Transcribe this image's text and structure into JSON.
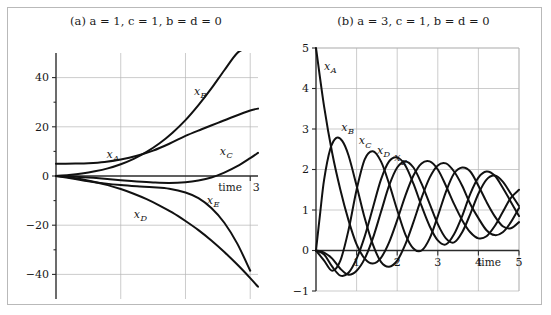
{
  "figure": {
    "panels": [
      {
        "id": "a",
        "title_prefix": "(a)",
        "title": "(a) a = 1,  c = 1,  b = d = 0",
        "params": {
          "a": "1",
          "c": "1",
          "b_d": "0"
        },
        "xlabel": "time",
        "x_ticks": [
          "3"
        ],
        "y_ticks": [
          "40",
          "20",
          "0",
          "−20",
          "−40"
        ],
        "curve_labels": [
          "x",
          "x",
          "x",
          "x",
          "x"
        ],
        "curve_subs": [
          "A",
          "B",
          "C",
          "D",
          "E"
        ]
      },
      {
        "id": "b",
        "title_prefix": "(b)",
        "title": "(b) a = 3, c = 1,  b = d = 0",
        "params": {
          "a": "3",
          "c": "1",
          "b_d": "0"
        },
        "xlabel": "time",
        "x_ticks": [
          "1",
          "2",
          "3",
          "4",
          "5"
        ],
        "y_ticks": [
          "5",
          "4",
          "3",
          "2",
          "1",
          "0",
          "−1"
        ],
        "curve_labels": [
          "x",
          "x",
          "x",
          "x",
          "x"
        ],
        "curve_subs": [
          "A",
          "B",
          "C",
          "D",
          "E"
        ]
      }
    ]
  },
  "chart_data": [
    {
      "type": "line",
      "panel": "a",
      "title": "(a) a = 1, c = 1, b = d = 0",
      "xlabel": "time",
      "ylabel": "",
      "xlim": [
        0,
        3.12
      ],
      "ylim": [
        -50,
        50
      ],
      "xticks": [
        3
      ],
      "yticks": [
        40,
        20,
        0,
        -20,
        -40
      ],
      "grid": true,
      "legend": "inline-labels",
      "series": [
        {
          "name": "x_A",
          "label": "x_A",
          "label_at": [
            0.78,
            7.5
          ],
          "x": [
            0,
            0.15,
            0.3,
            0.5,
            0.75,
            1.0,
            1.25,
            1.5,
            1.75,
            2.0,
            2.25,
            2.5,
            2.75,
            3.0,
            3.12
          ],
          "y": [
            5.0,
            5.0,
            5.05,
            5.2,
            5.7,
            6.7,
            8.2,
            10.3,
            13.1,
            16.3,
            19.0,
            21.6,
            24.2,
            26.6,
            27.4
          ]
        },
        {
          "name": "x_B",
          "label": "x_B",
          "label_at": [
            2.13,
            33.0
          ],
          "x": [
            0,
            0.2,
            0.4,
            0.6,
            0.8,
            1.0,
            1.2,
            1.4,
            1.6,
            1.8,
            2.0,
            2.2,
            2.4,
            2.6,
            2.8,
            2.95
          ],
          "y": [
            0.0,
            0.4,
            1.0,
            1.9,
            3.1,
            4.8,
            7.0,
            9.8,
            13.3,
            17.6,
            22.7,
            28.8,
            35.6,
            43.0,
            50.0,
            52.0
          ]
        },
        {
          "name": "x_C",
          "label": "x_C",
          "label_at": [
            2.53,
            8.6
          ],
          "x": [
            0,
            0.25,
            0.5,
            0.75,
            1.0,
            1.25,
            1.5,
            1.75,
            2.0,
            2.2,
            2.4,
            2.6,
            2.8,
            3.0,
            3.12
          ],
          "y": [
            0.0,
            -0.2,
            -0.6,
            -1.1,
            -1.7,
            -2.2,
            -2.6,
            -2.8,
            -2.5,
            -1.8,
            -0.6,
            1.4,
            4.0,
            7.3,
            9.4
          ]
        },
        {
          "name": "x_D",
          "label": "x_D",
          "label_at": [
            1.2,
            -17.0
          ],
          "x": [
            0,
            0.2,
            0.4,
            0.6,
            0.8,
            1.0,
            1.2,
            1.4,
            1.6,
            1.8,
            2.0,
            2.2,
            2.4,
            2.6,
            2.8,
            3.0,
            3.12
          ],
          "y": [
            0.0,
            -0.5,
            -1.3,
            -2.4,
            -3.7,
            -5.3,
            -7.2,
            -9.4,
            -12.0,
            -14.9,
            -18.3,
            -22.0,
            -26.2,
            -30.9,
            -36.0,
            -41.5,
            -45.0
          ]
        },
        {
          "name": "x_E",
          "label": "x_E",
          "label_at": [
            2.33,
            -11.5
          ],
          "x": [
            0,
            0.25,
            0.5,
            0.75,
            1.0,
            1.25,
            1.5,
            1.75,
            2.0,
            2.2,
            2.4,
            2.6,
            2.8,
            3.0
          ],
          "y": [
            0.0,
            -1.0,
            -2.1,
            -3.0,
            -3.7,
            -4.2,
            -4.6,
            -5.2,
            -6.7,
            -9.0,
            -13.0,
            -19.0,
            -27.5,
            -38.5
          ]
        }
      ]
    },
    {
      "type": "line",
      "panel": "b",
      "title": "(b) a = 3, c = 1, b = d = 0",
      "xlabel": "time",
      "ylabel": "",
      "xlim": [
        0,
        5.0
      ],
      "ylim": [
        -1,
        5
      ],
      "xticks": [
        1,
        2,
        3,
        4,
        5
      ],
      "yticks": [
        5,
        4,
        3,
        2,
        1,
        0,
        -1
      ],
      "grid": true,
      "legend": "inline-labels",
      "comment": "Five damped oscillations with progressively delayed phase; amplitude decays toward mean ~1.0",
      "series": [
        {
          "name": "x_A",
          "label": "x_A",
          "label_at": [
            0.2,
            4.45
          ],
          "description": "starts at 5, decays steeply, then oscillates about 1",
          "x": [
            0,
            0.2,
            0.4,
            0.6,
            0.8,
            1.0,
            1.2,
            1.4,
            1.6,
            1.8,
            2.0,
            2.2,
            2.4,
            2.6,
            2.8,
            3.0,
            3.2,
            3.4,
            3.6,
            3.8,
            4.0,
            4.2,
            4.4,
            4.6,
            4.8,
            5.0
          ],
          "y": [
            5.0,
            3.55,
            2.4,
            1.5,
            0.75,
            0.15,
            -0.2,
            -0.32,
            -0.18,
            0.2,
            0.75,
            1.35,
            1.85,
            2.15,
            2.2,
            2.0,
            1.6,
            1.15,
            0.75,
            0.45,
            0.3,
            0.35,
            0.6,
            0.95,
            1.3,
            1.5
          ]
        },
        {
          "name": "x_B",
          "label": "x_B",
          "label_at": [
            0.62,
            2.95
          ],
          "x": [
            0,
            0.1,
            0.2,
            0.35,
            0.5,
            0.65,
            0.8,
            1.0,
            1.2,
            1.4,
            1.6,
            1.8,
            2.0,
            2.2,
            2.4,
            2.6,
            2.8,
            3.0,
            3.2,
            3.4,
            3.6,
            3.8,
            4.0,
            4.2,
            4.4,
            4.6,
            4.8,
            5.0
          ],
          "y": [
            0.0,
            0.9,
            1.75,
            2.5,
            2.78,
            2.7,
            2.35,
            1.6,
            0.8,
            0.15,
            -0.28,
            -0.4,
            -0.25,
            0.15,
            0.7,
            1.3,
            1.8,
            2.1,
            2.15,
            1.95,
            1.6,
            1.15,
            0.8,
            0.5,
            0.38,
            0.45,
            0.7,
            1.05
          ]
        },
        {
          "name": "x_C",
          "label": "x_C",
          "label_at": [
            1.05,
            2.62
          ],
          "x": [
            0,
            0.2,
            0.4,
            0.6,
            0.8,
            1.0,
            1.2,
            1.4,
            1.6,
            1.8,
            2.0,
            2.2,
            2.4,
            2.6,
            2.8,
            3.0,
            3.2,
            3.4,
            3.6,
            3.8,
            4.0,
            4.2,
            4.4,
            4.6,
            4.8,
            5.0
          ],
          "y": [
            0.0,
            -0.25,
            -0.5,
            -0.25,
            0.5,
            1.5,
            2.25,
            2.45,
            2.2,
            1.65,
            1.0,
            0.4,
            0.05,
            0.0,
            0.3,
            0.85,
            1.45,
            1.9,
            2.05,
            1.95,
            1.6,
            1.2,
            0.85,
            0.6,
            0.55,
            0.7
          ]
        },
        {
          "name": "x_D",
          "label": "x_D",
          "label_at": [
            1.5,
            2.38
          ],
          "x": [
            0,
            0.2,
            0.4,
            0.6,
            0.8,
            1.0,
            1.2,
            1.4,
            1.6,
            1.8,
            2.0,
            2.2,
            2.4,
            2.6,
            2.8,
            3.0,
            3.2,
            3.4,
            3.6,
            3.8,
            4.0,
            4.2,
            4.4,
            4.6,
            4.8,
            5.0
          ],
          "y": [
            0.0,
            -0.1,
            -0.4,
            -0.62,
            -0.55,
            -0.2,
            0.35,
            1.05,
            1.75,
            2.2,
            2.3,
            2.1,
            1.65,
            1.1,
            0.6,
            0.25,
            0.15,
            0.4,
            0.85,
            1.4,
            1.8,
            1.95,
            1.85,
            1.55,
            1.2,
            0.85
          ]
        },
        {
          "name": "x_E",
          "label": "x_E",
          "label_at": [
            1.93,
            2.2
          ],
          "x": [
            0,
            0.2,
            0.4,
            0.6,
            0.8,
            1.0,
            1.2,
            1.4,
            1.6,
            1.8,
            2.0,
            2.2,
            2.4,
            2.6,
            2.8,
            3.0,
            3.2,
            3.4,
            3.6,
            3.8,
            4.0,
            4.2,
            4.4,
            4.6,
            4.8,
            5.0
          ],
          "y": [
            0.0,
            -0.05,
            -0.2,
            -0.45,
            -0.6,
            -0.5,
            -0.2,
            0.3,
            0.95,
            1.6,
            2.05,
            2.2,
            2.05,
            1.65,
            1.15,
            0.65,
            0.3,
            0.2,
            0.45,
            0.9,
            1.4,
            1.75,
            1.85,
            1.7,
            1.4,
            1.1
          ]
        }
      ]
    }
  ]
}
